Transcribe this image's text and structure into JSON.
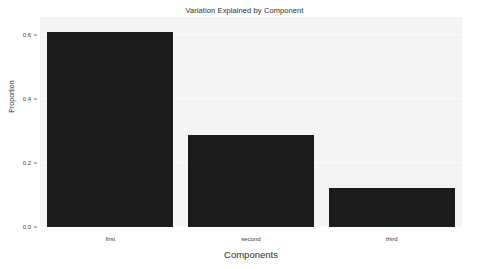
{
  "chart_data": {
    "type": "bar",
    "title": "Variation Explained by Component",
    "xlabel": "Components",
    "ylabel": "Proportion",
    "categories": [
      "first",
      "second",
      "third"
    ],
    "values": [
      0.607,
      0.287,
      0.122
    ],
    "ylim": [
      0.0,
      0.655
    ],
    "yticks": [
      0.0,
      0.2,
      0.4,
      0.6
    ],
    "ytick_labels": [
      "0.0",
      "0.2",
      "0.4",
      "0.6"
    ],
    "grid": false,
    "legend": "none",
    "colors": {
      "bar": "#1b1b1b",
      "panel_background": "#f4f4f4",
      "figure_background": "#ffffff",
      "text": "#2e2e2e",
      "tick": "#6e6e6e"
    }
  }
}
